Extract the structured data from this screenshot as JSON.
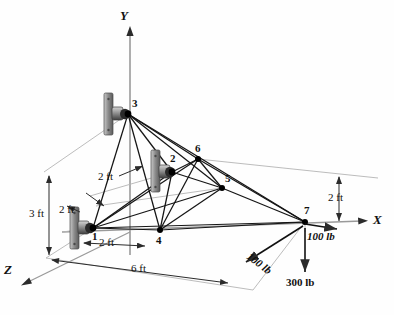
{
  "figure": {
    "background": "#fefefe",
    "member_color": "#1a1a1a",
    "axis_color": "#8d8d8d",
    "dim_color": "#2b2b2b",
    "node_color": "#000000"
  },
  "axes": [
    {
      "id": "y",
      "label": "Y",
      "x": 124,
      "y": 14,
      "direction": "up"
    },
    {
      "id": "x",
      "label": "X",
      "x": 374,
      "y": 219,
      "direction": "right"
    },
    {
      "id": "z",
      "label": "Z",
      "x": 6,
      "y": 268,
      "direction": "down-left"
    }
  ],
  "nodes": [
    {
      "id": "1",
      "label": "1",
      "x": 93,
      "y": 228,
      "label_x": 92,
      "label_y": 230,
      "supported": true
    },
    {
      "id": "2",
      "label": "2",
      "x": 172,
      "y": 172,
      "label_x": 170,
      "label_y": 152,
      "supported": true
    },
    {
      "id": "3",
      "label": "3",
      "x": 128,
      "y": 114,
      "label_x": 132,
      "label_y": 97,
      "supported": true
    },
    {
      "id": "4",
      "label": "4",
      "x": 160,
      "y": 230,
      "label_x": 156,
      "label_y": 234,
      "supported": false
    },
    {
      "id": "5",
      "label": "5",
      "x": 222,
      "y": 188,
      "label_x": 224,
      "label_y": 171,
      "supported": false
    },
    {
      "id": "6",
      "label": "6",
      "x": 198,
      "y": 159,
      "label_x": 196,
      "label_y": 142,
      "supported": false
    },
    {
      "id": "7",
      "label": "7",
      "x": 305,
      "y": 222,
      "label_x": 304,
      "label_y": 204,
      "supported": false
    }
  ],
  "members": [
    [
      "3",
      "1"
    ],
    [
      "3",
      "2"
    ],
    [
      "3",
      "4"
    ],
    [
      "3",
      "5"
    ],
    [
      "3",
      "6"
    ],
    [
      "3",
      "7"
    ],
    [
      "1",
      "2"
    ],
    [
      "1",
      "4"
    ],
    [
      "1",
      "5"
    ],
    [
      "1",
      "6"
    ],
    [
      "1",
      "7"
    ],
    [
      "2",
      "4"
    ],
    [
      "2",
      "5"
    ],
    [
      "2",
      "6"
    ],
    [
      "4",
      "5"
    ],
    [
      "4",
      "6"
    ],
    [
      "4",
      "7"
    ],
    [
      "5",
      "6"
    ],
    [
      "5",
      "7"
    ],
    [
      "6",
      "7"
    ]
  ],
  "supports": [
    {
      "node": "3",
      "x": 108,
      "y": 113,
      "type": "ball-and-socket-wall-bracket"
    },
    {
      "node": "2",
      "x": 155,
      "y": 172,
      "type": "ball-and-socket-wall-bracket"
    },
    {
      "node": "1",
      "x": 74,
      "y": 228,
      "type": "ball-and-socket-wall-bracket"
    }
  ],
  "dimensions": [
    {
      "id": "height-3ft",
      "label": "3 ft",
      "x": 41,
      "y": 213,
      "orientation": "vertical"
    },
    {
      "id": "lead-2ft-upper",
      "label": "2 ft",
      "x": 98,
      "y": 176,
      "orientation": "leader"
    },
    {
      "id": "lead-2ft-lower",
      "label": "2 ft",
      "x": 58,
      "y": 208,
      "orientation": "leader"
    },
    {
      "id": "span-2ft",
      "label": "2 ft",
      "x": 100,
      "y": 243,
      "orientation": "horizontal"
    },
    {
      "id": "depth-6ft",
      "label": "6 ft",
      "x": 131,
      "y": 267,
      "orientation": "diagonal-z"
    },
    {
      "id": "height-2ft-right",
      "label": "2 ft",
      "x": 330,
      "y": 196,
      "orientation": "vertical"
    }
  ],
  "forces": [
    {
      "id": "force-x",
      "label": "100 lb",
      "x": 308,
      "y": 229,
      "direction": "+X",
      "magnitude": 100,
      "unit": "lb"
    },
    {
      "id": "force-z",
      "label": "100 lb",
      "x": 252,
      "y": 248,
      "direction": "+Z",
      "magnitude": 100,
      "unit": "lb",
      "rotated": true
    },
    {
      "id": "force-y",
      "label": "300 lb",
      "x": 288,
      "y": 283,
      "direction": "-Y",
      "magnitude": 300,
      "unit": "lb"
    }
  ]
}
